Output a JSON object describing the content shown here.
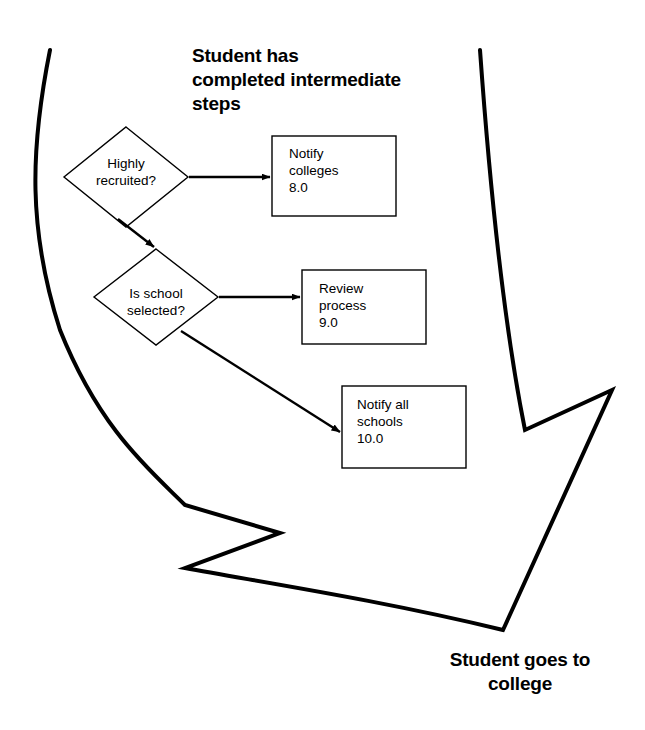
{
  "diagram": {
    "type": "flowchart",
    "title_top": "Student has\ncompleted intermediate\nsteps",
    "title_bottom": "Student goes to\ncollege",
    "stroke_color": "#000000",
    "fill_color": "#ffffff",
    "background_color": "#ffffff",
    "outline_arrow": {
      "name": "curved-banner-arrow",
      "direction": "down-right",
      "stroke_width": 4
    },
    "nodes": [
      {
        "id": "decision-highly-recruited",
        "shape": "diamond",
        "label": "Highly\nrecruited?",
        "cx": 126,
        "cy": 177,
        "rx": 62,
        "ry": 50
      },
      {
        "id": "decision-is-school-selected",
        "shape": "diamond",
        "label": "Is school\nselected?",
        "cx": 156,
        "cy": 297,
        "rx": 62,
        "ry": 48
      },
      {
        "id": "process-notify-colleges",
        "shape": "rectangle",
        "label": "Notify\ncolleges\n8.0",
        "text": "Notify colleges",
        "value": "8.0",
        "x": 272,
        "y": 136,
        "w": 124,
        "h": 80
      },
      {
        "id": "process-review-process",
        "shape": "rectangle",
        "label": "Review\nprocess\n9.0",
        "text": "Review process",
        "value": "9.0",
        "x": 302,
        "y": 270,
        "w": 124,
        "h": 74
      },
      {
        "id": "process-notify-all-schools",
        "shape": "rectangle",
        "label": "Notify all\nschools\n10.0",
        "text": "Notify all schools",
        "value": "10.0",
        "x": 342,
        "y": 386,
        "w": 124,
        "h": 82
      }
    ],
    "connectors": [
      {
        "id": "edge-recruited-to-notify-colleges",
        "from": "decision-highly-recruited",
        "to": "process-notify-colleges",
        "style": "straight-arrow"
      },
      {
        "id": "edge-recruited-to-school-selected",
        "from": "decision-highly-recruited",
        "to": "decision-is-school-selected",
        "style": "diagonal-arrow"
      },
      {
        "id": "edge-school-selected-to-review",
        "from": "decision-is-school-selected",
        "to": "process-review-process",
        "style": "straight-arrow"
      },
      {
        "id": "edge-school-selected-to-notify-all",
        "from": "decision-is-school-selected",
        "to": "process-notify-all-schools",
        "style": "diagonal-arrow"
      }
    ]
  }
}
